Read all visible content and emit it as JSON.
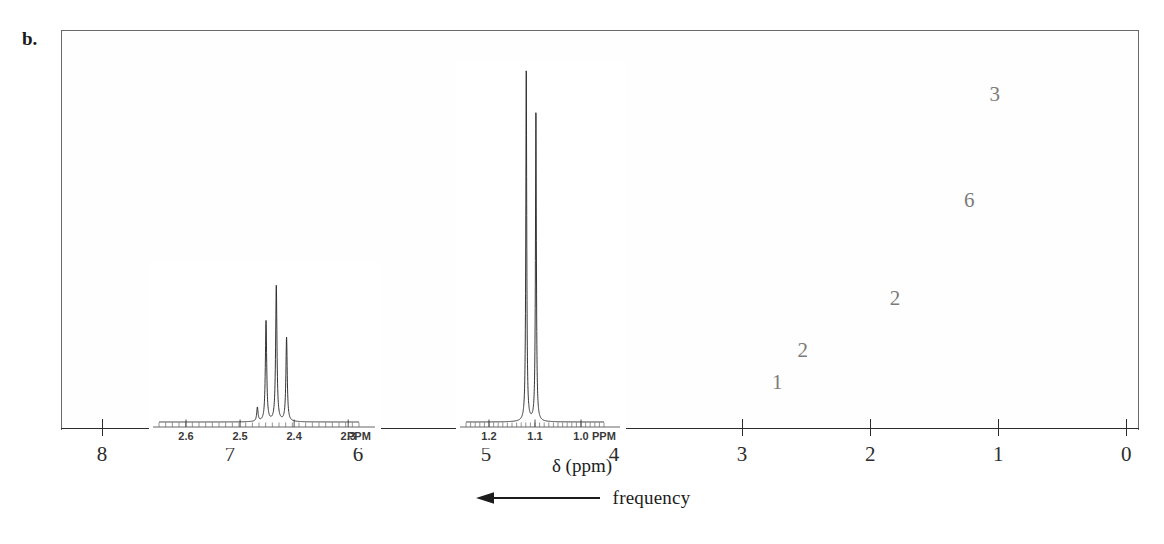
{
  "panel": {
    "label": "b."
  },
  "axis": {
    "title_delta": "δ (ppm)",
    "frequency_label": "frequency",
    "arrow_icon": "left-arrow-icon",
    "tick_labels": [
      "8",
      "7",
      "6",
      "5",
      "4",
      "3",
      "2",
      "1",
      "0"
    ],
    "tick_values": [
      8,
      7,
      6,
      5,
      4,
      3,
      2,
      1,
      0
    ],
    "xlim": [
      8.32,
      -0.1
    ]
  },
  "integration_labels": [
    {
      "text": "1",
      "ppm": 2.72,
      "y_frac": 0.885
    },
    {
      "text": "2",
      "ppm": 2.52,
      "y_frac": 0.805
    },
    {
      "text": "2",
      "ppm": 1.8,
      "y_frac": 0.675
    },
    {
      "text": "6",
      "ppm": 1.22,
      "y_frac": 0.43
    },
    {
      "text": "3",
      "ppm": 1.02,
      "y_frac": 0.165
    }
  ],
  "insets": {
    "left": {
      "name": "inset-quartet-2.4ppm",
      "ppm_range": [
        2.65,
        2.28
      ],
      "tick_labels": [
        "2.6",
        "2.5",
        "2.4",
        "2.3"
      ],
      "tick_values": [
        2.6,
        2.5,
        2.4,
        2.3
      ],
      "unit_label": "PPM"
    },
    "right": {
      "name": "inset-doublet-1.1ppm",
      "ppm_range": [
        1.25,
        0.95
      ],
      "tick_labels": [
        "1.2",
        "1.1",
        "1.0"
      ],
      "tick_values": [
        1.2,
        1.1,
        1.0
      ],
      "unit_label": "PPM"
    }
  },
  "colors": {
    "trace": "#1a1a1a",
    "integral": "#8c8c8c",
    "grid_major": "#b9b9b9",
    "grid_minor": "#d9d9d9",
    "frame": "#6a6a6a",
    "axis": "#2b2b2b",
    "text": "#1c1c1c",
    "int_label": "#7b7b7b"
  },
  "chart_data": {
    "type": "line",
    "title": "",
    "xlabel": "δ (ppm)",
    "ylabel": "",
    "xlim": [
      8.32,
      -0.1
    ],
    "ylim": [
      0,
      1
    ],
    "grid": true,
    "legend": "none",
    "x_axis_reversed": true,
    "annotations": [
      {
        "text": "b.",
        "kind": "panel-label"
      },
      {
        "text": "frequency",
        "kind": "axis-direction",
        "direction": "left"
      }
    ],
    "series": [
      {
        "name": "1H NMR spectrum",
        "peaks": [
          {
            "ppm": 2.62,
            "height": 0.105,
            "width": 0.012,
            "multiplicity": "multiplet",
            "lines": [
              2.655,
              2.64,
              2.625,
              2.61,
              2.595,
              2.58
            ],
            "integration": 1
          },
          {
            "ppm": 2.44,
            "height": 0.175,
            "width": 0.01,
            "multiplicity": "quartet",
            "lines": [
              2.465,
              2.45,
              2.435,
              2.42
            ],
            "integration": 2
          },
          {
            "ppm": 2.15,
            "height": 0.012,
            "width": 0.008,
            "multiplicity": "singlet"
          },
          {
            "ppm": 1.62,
            "height": 0.155,
            "width": 0.01,
            "multiplicity": "sextet",
            "lines": [
              1.655,
              1.64,
              1.625,
              1.61,
              1.595,
              1.58
            ],
            "integration": 2
          },
          {
            "ppm": 1.42,
            "height": 0.01,
            "width": 0.008,
            "multiplicity": "singlet"
          },
          {
            "ppm": 1.11,
            "height": 0.975,
            "width": 0.008,
            "multiplicity": "doublet",
            "lines": [
              1.125,
              1.095
            ],
            "integration": 6
          },
          {
            "ppm": 0.93,
            "height": 0.4,
            "width": 0.009,
            "multiplicity": "doublet",
            "lines": [
              0.945,
              0.915
            ],
            "integration": 3
          },
          {
            "ppm": 0.0,
            "height": 0.145,
            "width": 0.007,
            "multiplicity": "singlet",
            "label": "TMS"
          }
        ]
      },
      {
        "name": "integration trace",
        "steps": [
          {
            "ppm": 8.3,
            "level": 0.005
          },
          {
            "ppm": 7.45,
            "level": 0.02
          },
          {
            "ppm": 3.1,
            "level": 0.06
          },
          {
            "ppm": 2.7,
            "level": 0.115
          },
          {
            "ppm": 2.5,
            "level": 0.255
          },
          {
            "ppm": 1.72,
            "level": 0.3
          },
          {
            "ppm": 1.54,
            "level": 0.43
          },
          {
            "ppm": 1.2,
            "level": 0.62
          },
          {
            "ppm": 1.05,
            "level": 0.925
          },
          {
            "ppm": 0.85,
            "level": 0.96
          },
          {
            "ppm": -0.1,
            "level": 0.963
          }
        ]
      }
    ],
    "insets": [
      {
        "name": "left-inset",
        "xlim": [
          2.65,
          2.28
        ],
        "unit": "PPM",
        "ticks": [
          2.6,
          2.5,
          2.4,
          2.3
        ],
        "peaks": [
          {
            "ppm": 2.452,
            "height": 0.72
          },
          {
            "ppm": 2.433,
            "height": 0.97
          },
          {
            "ppm": 2.414,
            "height": 0.6
          },
          {
            "ppm": 2.468,
            "height": 0.1
          }
        ],
        "multiplicity": "quartet-like"
      },
      {
        "name": "right-inset",
        "xlim": [
          1.25,
          0.95
        ],
        "unit": "PPM",
        "ticks": [
          1.2,
          1.1,
          1.0
        ],
        "peaks": [
          {
            "ppm": 1.119,
            "height": 1.0
          },
          {
            "ppm": 1.098,
            "height": 0.88
          }
        ],
        "multiplicity": "doublet"
      }
    ]
  }
}
